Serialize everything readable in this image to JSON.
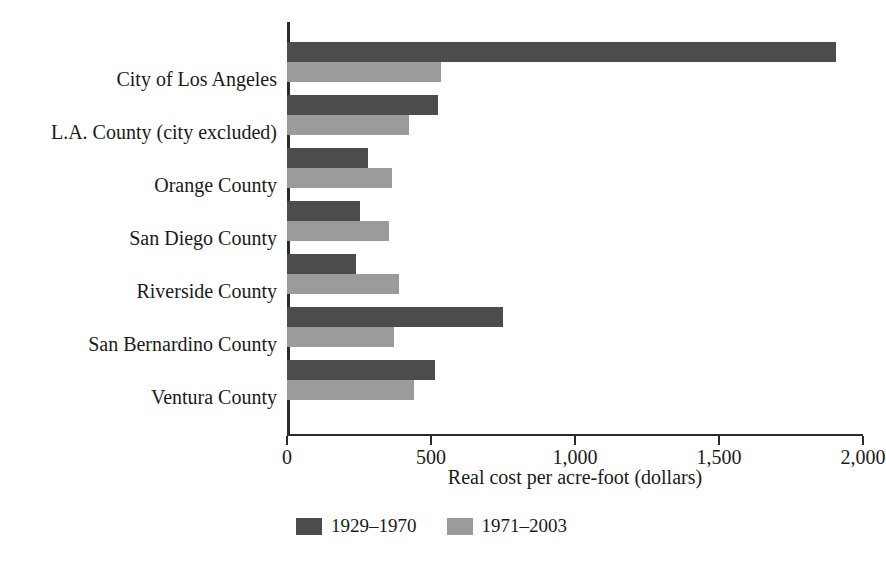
{
  "chart_data": {
    "type": "bar",
    "orientation": "horizontal",
    "title": "",
    "xlabel": "Real cost per acre-foot (dollars)",
    "ylabel": "",
    "xlim": [
      0,
      2000
    ],
    "xticks": [
      0,
      500,
      1000,
      1500,
      2000
    ],
    "xticklabels": [
      "0",
      "500",
      "1,000",
      "1,500",
      "2,000"
    ],
    "grid": false,
    "legend_position": "bottom-center",
    "categories": [
      "City of Los Angeles",
      "L.A. County (city excluded)",
      "Orange County",
      "San Diego County",
      "Riverside County",
      "San Bernardino County",
      "Ventura County"
    ],
    "series": [
      {
        "name": "1929–1970",
        "color": "#4c4c4c",
        "values": [
          1905,
          525,
          280,
          255,
          240,
          750,
          515
        ]
      },
      {
        "name": "1971–2003",
        "color": "#9b9b9b",
        "values": [
          535,
          425,
          365,
          355,
          390,
          370,
          440
        ]
      }
    ]
  },
  "legend": {
    "items": [
      {
        "label": "1929–1970",
        "color": "#4c4c4c"
      },
      {
        "label": "1971–2003",
        "color": "#9b9b9b"
      }
    ]
  }
}
